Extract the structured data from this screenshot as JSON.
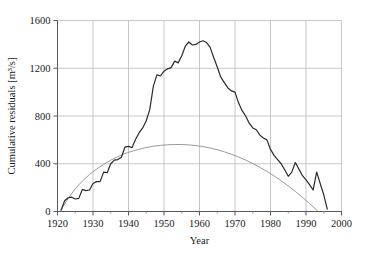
{
  "chart_data": {
    "type": "line",
    "title": "",
    "xlabel": "Year",
    "ylabel": "Cumulative residuals  [m³/s]",
    "ylabel_main": "Cumulative residuals",
    "ylabel_units": "[m³/s]",
    "xlim": [
      1920,
      2000
    ],
    "ylim": [
      0,
      1600
    ],
    "xticks": [
      1920,
      1930,
      1940,
      1950,
      1960,
      1970,
      1980,
      1990,
      2000
    ],
    "xtick_labels": [
      "1920",
      "1930",
      "1940",
      "1950",
      "1960",
      "1970",
      "1980",
      "1990",
      "2000"
    ],
    "yticks": [
      0,
      400,
      800,
      1200,
      1600
    ],
    "ytick_labels": [
      "0",
      "400",
      "800",
      "1200",
      "1600"
    ],
    "grid": true,
    "grid_color": "#b9b9b9",
    "legend": "none",
    "series": [
      {
        "name": "Cumulative residuals",
        "color": "#2b2b2b",
        "width": 1.2,
        "x": [
          1921,
          1922,
          1923,
          1924,
          1925,
          1926,
          1927,
          1928,
          1929,
          1930,
          1931,
          1932,
          1933,
          1934,
          1935,
          1936,
          1937,
          1938,
          1939,
          1940,
          1941,
          1942,
          1943,
          1944,
          1945,
          1946,
          1947,
          1948,
          1949,
          1950,
          1951,
          1952,
          1953,
          1954,
          1955,
          1956,
          1957,
          1958,
          1959,
          1960,
          1961,
          1962,
          1963,
          1964,
          1965,
          1966,
          1967,
          1968,
          1969,
          1970,
          1971,
          1972,
          1973,
          1974,
          1975,
          1976,
          1977,
          1978,
          1979,
          1980,
          1981,
          1982,
          1983,
          1984,
          1985,
          1986,
          1987,
          1988,
          1989,
          1990,
          1991,
          1992,
          1993,
          1994,
          1995,
          1996
        ],
        "values": [
          10,
          90,
          115,
          120,
          105,
          110,
          185,
          175,
          180,
          235,
          250,
          250,
          330,
          325,
          400,
          430,
          435,
          455,
          540,
          545,
          535,
          605,
          660,
          700,
          760,
          855,
          1050,
          1145,
          1135,
          1175,
          1195,
          1205,
          1260,
          1245,
          1305,
          1385,
          1420,
          1395,
          1400,
          1420,
          1430,
          1415,
          1375,
          1290,
          1210,
          1125,
          1080,
          1035,
          1010,
          1000,
          910,
          845,
          800,
          740,
          700,
          685,
          640,
          615,
          600,
          520,
          470,
          435,
          400,
          350,
          295,
          330,
          410,
          355,
          300,
          265,
          225,
          180,
          330,
          235,
          140,
          20
        ]
      },
      {
        "name": "Fitted parabola",
        "color": "#8f8f8f",
        "width": 0.9,
        "x": [
          1921,
          1923,
          1925,
          1927,
          1929,
          1931,
          1933,
          1935,
          1937,
          1939,
          1941,
          1943,
          1945,
          1947,
          1949,
          1951,
          1953,
          1955,
          1957,
          1959,
          1961,
          1963,
          1965,
          1967,
          1969,
          1971,
          1973,
          1975,
          1977,
          1979,
          1981,
          1983,
          1985,
          1987,
          1989,
          1991,
          1993,
          1995,
          1996
        ],
        "values": [
          15,
          110,
          190,
          255,
          310,
          355,
          395,
          430,
          460,
          485,
          505,
          522,
          536,
          547,
          554,
          559,
          561,
          561,
          558,
          552,
          543,
          532,
          517,
          500,
          480,
          457,
          431,
          402,
          370,
          336,
          298,
          258,
          214,
          168,
          119,
          66,
          12,
          -45,
          -75
        ]
      }
    ]
  }
}
